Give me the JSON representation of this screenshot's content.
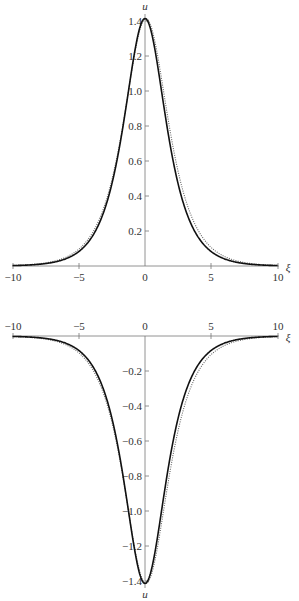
{
  "chart_data": [
    {
      "type": "line",
      "title": "",
      "xlabel": "ξ",
      "ylabel": "u",
      "xlim": [
        -10,
        10
      ],
      "ylim": [
        0,
        1.42
      ],
      "x_ticks": [
        "-10",
        "-5",
        "0",
        "5",
        "10"
      ],
      "y_ticks": [
        "0.2",
        "0.4",
        "0.6",
        "0.8",
        "1.0",
        "1.2",
        "1.4"
      ],
      "grid": false,
      "legend": "none",
      "series": [
        {
          "name": "solid",
          "style": "solid",
          "x": [
            -10,
            -8,
            -6,
            -5,
            -4,
            -3,
            -2,
            -1.5,
            -1,
            -0.5,
            0,
            0.5,
            1,
            1.5,
            2,
            3,
            4,
            5,
            6,
            8,
            10
          ],
          "values": [
            0.002,
            0.01,
            0.041,
            0.082,
            0.164,
            0.32,
            0.596,
            0.79,
            1.0,
            1.3,
            1.414,
            1.3,
            1.0,
            0.79,
            0.596,
            0.32,
            0.164,
            0.082,
            0.041,
            0.01,
            0.002
          ]
        },
        {
          "name": "dotted",
          "style": "dotted",
          "x": [
            -10,
            -8,
            -6,
            -5,
            -4,
            -3,
            -2,
            -1.5,
            -1,
            -0.5,
            0,
            0.5,
            1,
            1.5,
            2,
            3,
            4,
            5,
            6,
            8,
            10
          ],
          "values": [
            0.003,
            0.013,
            0.05,
            0.095,
            0.185,
            0.35,
            0.63,
            0.82,
            1.03,
            1.31,
            1.414,
            1.31,
            1.03,
            0.82,
            0.63,
            0.35,
            0.185,
            0.095,
            0.05,
            0.013,
            0.003
          ]
        }
      ]
    },
    {
      "type": "line",
      "title": "",
      "xlabel": "ξ",
      "ylabel": "u",
      "xlim": [
        -10,
        10
      ],
      "ylim": [
        -1.42,
        0
      ],
      "x_ticks": [
        "-10",
        "-5",
        "0",
        "5",
        "10"
      ],
      "y_ticks": [
        "-0.2",
        "-0.4",
        "-0.6",
        "-0.8",
        "-1.0",
        "-1.2",
        "-1.4"
      ],
      "grid": false,
      "legend": "none",
      "series": [
        {
          "name": "solid",
          "style": "solid",
          "x": [
            -10,
            -8,
            -6,
            -5,
            -4,
            -3,
            -2,
            -1.5,
            -1,
            -0.5,
            0,
            0.5,
            1,
            1.5,
            2,
            3,
            4,
            5,
            6,
            8,
            10
          ],
          "values": [
            -0.002,
            -0.01,
            -0.041,
            -0.082,
            -0.164,
            -0.32,
            -0.596,
            -0.79,
            -1.0,
            -1.3,
            -1.414,
            -1.3,
            -1.0,
            -0.79,
            -0.596,
            -0.32,
            -0.164,
            -0.082,
            -0.041,
            -0.01,
            -0.002
          ]
        },
        {
          "name": "dotted",
          "style": "dotted",
          "x": [
            -10,
            -8,
            -6,
            -5,
            -4,
            -3,
            -2,
            -1.5,
            -1,
            -0.5,
            0,
            0.5,
            1,
            1.5,
            2,
            3,
            4,
            5,
            6,
            8,
            10
          ],
          "values": [
            -0.003,
            -0.013,
            -0.05,
            -0.095,
            -0.185,
            -0.35,
            -0.63,
            -0.82,
            -1.03,
            -1.31,
            -1.414,
            -1.31,
            -1.03,
            -0.82,
            -0.63,
            -0.35,
            -0.185,
            -0.095,
            -0.05,
            -0.013,
            -0.003
          ]
        }
      ]
    }
  ],
  "top": {
    "ylabel": "u",
    "xlabel": "ξ",
    "xticks": [
      "−10",
      "−5",
      "0",
      "5",
      "10"
    ],
    "yticks": [
      "0.2",
      "0.4",
      "0.6",
      "0.8",
      "1.0",
      "1.2",
      "1.4"
    ]
  },
  "bottom": {
    "ylabel": "u",
    "xlabel": "ξ",
    "xticks": [
      "−10",
      "−5",
      "0",
      "5",
      "10"
    ],
    "yticks": [
      "−0.2",
      "−0.4",
      "−0.6",
      "−0.8",
      "−1.0",
      "−1.2",
      "−1.4"
    ]
  }
}
